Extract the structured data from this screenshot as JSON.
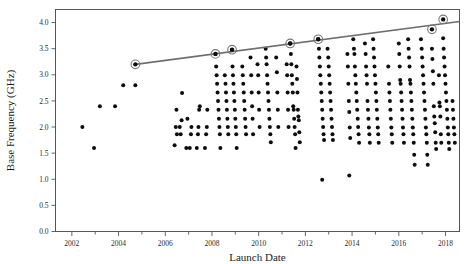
{
  "chart_data": {
    "type": "scatter",
    "title": "",
    "xlabel": "Launch Date",
    "ylabel": "Base Frequency (GHz)",
    "xlim": [
      2001.3,
      2018.6
    ],
    "ylim": [
      0.0,
      4.25
    ],
    "grid": false,
    "legend": "none",
    "x_ticks_major": [
      2002,
      2004,
      2006,
      2008,
      2010,
      2012,
      2014,
      2016,
      2018
    ],
    "x_ticks_minor": [
      2003,
      2005,
      2007,
      2009,
      2011,
      2013,
      2015,
      2017
    ],
    "y_ticks": [
      0.0,
      0.5,
      1.0,
      1.5,
      2.0,
      2.5,
      3.0,
      3.5,
      4.0
    ],
    "y_tick_labels": [
      "0.0",
      "0.5",
      "1.0",
      "1.5",
      "2.0",
      "2.5",
      "3.0",
      "3.5",
      "4.0"
    ],
    "x_tick_labels": [
      "2002",
      "2004",
      "2006",
      "2008",
      "2010",
      "2012",
      "2014",
      "2016",
      "2018"
    ],
    "series": [
      {
        "name": "Processors",
        "marker": "filled-circle",
        "color": "#0d0d0d",
        "points": [
          [
            2002.45,
            2.0
          ],
          [
            2002.95,
            1.6
          ],
          [
            2003.2,
            2.4
          ],
          [
            2003.85,
            2.4
          ],
          [
            2004.2,
            2.8
          ],
          [
            2004.72,
            2.8
          ],
          [
            2006.4,
            1.65
          ],
          [
            2006.45,
            2.0
          ],
          [
            2006.48,
            2.33
          ],
          [
            2006.5,
            1.86
          ],
          [
            2006.62,
            2.0
          ],
          [
            2006.66,
            1.86
          ],
          [
            2006.7,
            2.13
          ],
          [
            2006.72,
            2.65
          ],
          [
            2006.9,
            1.6
          ],
          [
            2006.95,
            2.16
          ],
          [
            2007.05,
            1.6
          ],
          [
            2007.1,
            1.86
          ],
          [
            2007.12,
            2.0
          ],
          [
            2007.35,
            1.6
          ],
          [
            2007.4,
            1.86
          ],
          [
            2007.42,
            2.0
          ],
          [
            2007.45,
            2.33
          ],
          [
            2007.48,
            2.4
          ],
          [
            2007.7,
            1.6
          ],
          [
            2007.75,
            1.86
          ],
          [
            2007.78,
            2.0
          ],
          [
            2007.8,
            2.33
          ],
          [
            2008.15,
            3.4
          ],
          [
            2008.18,
            3.16
          ],
          [
            2008.2,
            2.99
          ],
          [
            2008.22,
            2.83
          ],
          [
            2008.24,
            2.66
          ],
          [
            2008.26,
            2.5
          ],
          [
            2008.28,
            2.33
          ],
          [
            2008.3,
            2.16
          ],
          [
            2008.32,
            2.0
          ],
          [
            2008.34,
            1.86
          ],
          [
            2008.36,
            1.6
          ],
          [
            2008.55,
            2.99
          ],
          [
            2008.58,
            2.83
          ],
          [
            2008.6,
            2.66
          ],
          [
            2008.62,
            2.5
          ],
          [
            2008.64,
            2.33
          ],
          [
            2008.66,
            2.16
          ],
          [
            2008.68,
            2.0
          ],
          [
            2008.7,
            1.86
          ],
          [
            2008.86,
            3.48
          ],
          [
            2008.88,
            3.16
          ],
          [
            2008.9,
            2.99
          ],
          [
            2008.92,
            2.83
          ],
          [
            2008.94,
            2.66
          ],
          [
            2008.96,
            2.5
          ],
          [
            2008.98,
            2.33
          ],
          [
            2009.0,
            2.16
          ],
          [
            2009.02,
            2.0
          ],
          [
            2009.04,
            1.86
          ],
          [
            2009.06,
            1.6
          ],
          [
            2009.3,
            3.16
          ],
          [
            2009.32,
            2.99
          ],
          [
            2009.34,
            2.83
          ],
          [
            2009.36,
            2.66
          ],
          [
            2009.38,
            2.5
          ],
          [
            2009.4,
            2.33
          ],
          [
            2009.42,
            2.16
          ],
          [
            2009.44,
            2.0
          ],
          [
            2009.46,
            1.86
          ],
          [
            2009.65,
            3.33
          ],
          [
            2009.68,
            2.99
          ],
          [
            2009.7,
            2.66
          ],
          [
            2009.72,
            2.4
          ],
          [
            2009.74,
            2.16
          ],
          [
            2009.76,
            1.86
          ],
          [
            2009.95,
            3.2
          ],
          [
            2009.98,
            2.99
          ],
          [
            2010.0,
            2.66
          ],
          [
            2010.02,
            2.33
          ],
          [
            2010.04,
            2.0
          ],
          [
            2010.3,
            3.5
          ],
          [
            2010.32,
            3.33
          ],
          [
            2010.34,
            3.2
          ],
          [
            2010.36,
            2.99
          ],
          [
            2010.38,
            2.83
          ],
          [
            2010.4,
            2.66
          ],
          [
            2010.42,
            2.5
          ],
          [
            2010.44,
            2.33
          ],
          [
            2010.46,
            2.16
          ],
          [
            2010.48,
            2.0
          ],
          [
            2010.5,
            1.86
          ],
          [
            2010.52,
            1.71
          ],
          [
            2010.75,
            3.33
          ],
          [
            2010.78,
            3.05
          ],
          [
            2010.8,
            2.66
          ],
          [
            2010.82,
            2.33
          ],
          [
            2010.84,
            2.0
          ],
          [
            2011.2,
            3.2
          ],
          [
            2011.22,
            2.99
          ],
          [
            2011.24,
            2.66
          ],
          [
            2011.26,
            2.33
          ],
          [
            2011.28,
            2.0
          ],
          [
            2011.35,
            3.6
          ],
          [
            2011.38,
            3.4
          ],
          [
            2011.4,
            3.2
          ],
          [
            2011.42,
            2.99
          ],
          [
            2011.44,
            2.83
          ],
          [
            2011.46,
            2.66
          ],
          [
            2011.48,
            2.4
          ],
          [
            2011.5,
            2.33
          ],
          [
            2011.52,
            2.16
          ],
          [
            2011.54,
            2.0
          ],
          [
            2011.56,
            1.86
          ],
          [
            2011.58,
            1.6
          ],
          [
            2011.62,
            3.16
          ],
          [
            2011.64,
            2.92
          ],
          [
            2011.66,
            2.66
          ],
          [
            2011.68,
            2.33
          ],
          [
            2011.7,
            2.2
          ],
          [
            2011.72,
            2.13
          ],
          [
            2011.74,
            1.9
          ],
          [
            2011.76,
            1.71
          ],
          [
            2012.55,
            3.68
          ],
          [
            2012.58,
            3.5
          ],
          [
            2012.6,
            3.33
          ],
          [
            2012.62,
            3.16
          ],
          [
            2012.64,
            2.99
          ],
          [
            2012.66,
            2.83
          ],
          [
            2012.68,
            2.66
          ],
          [
            2012.7,
            2.5
          ],
          [
            2012.72,
            2.33
          ],
          [
            2012.74,
            2.16
          ],
          [
            2012.76,
            2.0
          ],
          [
            2012.78,
            1.86
          ],
          [
            2012.8,
            1.75
          ],
          [
            2012.72,
            0.99
          ],
          [
            2012.95,
            3.5
          ],
          [
            2012.98,
            3.33
          ],
          [
            2013.0,
            3.16
          ],
          [
            2013.02,
            2.99
          ],
          [
            2013.04,
            2.83
          ],
          [
            2013.06,
            2.66
          ],
          [
            2013.08,
            2.5
          ],
          [
            2013.1,
            2.33
          ],
          [
            2013.12,
            2.16
          ],
          [
            2013.14,
            2.0
          ],
          [
            2013.16,
            1.86
          ],
          [
            2013.18,
            1.75
          ],
          [
            2013.8,
            3.4
          ],
          [
            2013.82,
            3.16
          ],
          [
            2013.84,
            2.83
          ],
          [
            2013.86,
            2.5
          ],
          [
            2013.88,
            2.29
          ],
          [
            2013.9,
            1.99
          ],
          [
            2013.92,
            1.79
          ],
          [
            2013.88,
            1.07
          ],
          [
            2014.05,
            3.68
          ],
          [
            2014.08,
            3.5
          ],
          [
            2014.1,
            3.4
          ],
          [
            2014.12,
            3.16
          ],
          [
            2014.14,
            2.99
          ],
          [
            2014.16,
            2.83
          ],
          [
            2014.18,
            2.66
          ],
          [
            2014.2,
            2.5
          ],
          [
            2014.22,
            2.33
          ],
          [
            2014.24,
            2.16
          ],
          [
            2014.26,
            2.0
          ],
          [
            2014.28,
            1.86
          ],
          [
            2014.3,
            1.7
          ],
          [
            2014.55,
            3.6
          ],
          [
            2014.58,
            3.4
          ],
          [
            2014.6,
            3.16
          ],
          [
            2014.62,
            2.99
          ],
          [
            2014.64,
            2.83
          ],
          [
            2014.66,
            2.5
          ],
          [
            2014.68,
            2.33
          ],
          [
            2014.7,
            2.16
          ],
          [
            2014.72,
            1.99
          ],
          [
            2014.74,
            1.86
          ],
          [
            2014.76,
            1.7
          ],
          [
            2014.9,
            3.68
          ],
          [
            2014.92,
            3.5
          ],
          [
            2014.94,
            3.33
          ],
          [
            2014.96,
            3.16
          ],
          [
            2014.98,
            2.99
          ],
          [
            2015.0,
            2.83
          ],
          [
            2015.02,
            2.66
          ],
          [
            2015.04,
            2.5
          ],
          [
            2015.06,
            2.33
          ],
          [
            2015.08,
            2.16
          ],
          [
            2015.1,
            1.99
          ],
          [
            2015.12,
            1.86
          ],
          [
            2015.14,
            1.7
          ],
          [
            2015.55,
            3.16
          ],
          [
            2015.58,
            2.83
          ],
          [
            2015.6,
            2.66
          ],
          [
            2015.62,
            2.5
          ],
          [
            2015.64,
            2.33
          ],
          [
            2015.66,
            2.16
          ],
          [
            2015.68,
            1.99
          ],
          [
            2015.7,
            1.86
          ],
          [
            2015.72,
            1.7
          ],
          [
            2016.0,
            3.6
          ],
          [
            2016.02,
            3.4
          ],
          [
            2016.04,
            3.16
          ],
          [
            2016.06,
            2.9
          ],
          [
            2016.08,
            2.83
          ],
          [
            2016.1,
            2.66
          ],
          [
            2016.12,
            2.5
          ],
          [
            2016.14,
            2.33
          ],
          [
            2016.16,
            2.16
          ],
          [
            2016.18,
            1.99
          ],
          [
            2016.2,
            1.86
          ],
          [
            2016.22,
            1.7
          ],
          [
            2016.4,
            3.68
          ],
          [
            2016.42,
            3.5
          ],
          [
            2016.44,
            3.33
          ],
          [
            2016.46,
            3.16
          ],
          [
            2016.48,
            2.9
          ],
          [
            2016.5,
            2.83
          ],
          [
            2016.52,
            2.66
          ],
          [
            2016.54,
            2.5
          ],
          [
            2016.56,
            2.33
          ],
          [
            2016.58,
            2.16
          ],
          [
            2016.6,
            1.99
          ],
          [
            2016.62,
            1.86
          ],
          [
            2016.64,
            1.7
          ],
          [
            2016.66,
            1.47
          ],
          [
            2016.68,
            1.28
          ],
          [
            2016.95,
            3.68
          ],
          [
            2016.98,
            3.5
          ],
          [
            2017.0,
            3.33
          ],
          [
            2017.02,
            3.16
          ],
          [
            2017.04,
            2.99
          ],
          [
            2017.06,
            2.83
          ],
          [
            2017.08,
            2.66
          ],
          [
            2017.1,
            2.5
          ],
          [
            2017.12,
            2.33
          ],
          [
            2017.14,
            2.16
          ],
          [
            2017.16,
            1.99
          ],
          [
            2017.18,
            1.86
          ],
          [
            2017.2,
            1.7
          ],
          [
            2017.22,
            1.47
          ],
          [
            2017.24,
            1.28
          ],
          [
            2017.42,
            3.5
          ],
          [
            2017.44,
            3.3
          ],
          [
            2017.46,
            3.07
          ],
          [
            2017.48,
            2.83
          ],
          [
            2017.5,
            2.4
          ],
          [
            2017.52,
            2.2
          ],
          [
            2017.54,
            2.07
          ],
          [
            2017.56,
            1.9
          ],
          [
            2017.58,
            1.7
          ],
          [
            2017.6,
            1.58
          ],
          [
            2017.72,
            2.99
          ],
          [
            2017.74,
            2.47
          ],
          [
            2017.76,
            2.4
          ],
          [
            2017.78,
            2.2
          ],
          [
            2017.8,
            1.86
          ],
          [
            2017.82,
            1.7
          ],
          [
            2017.9,
            3.7
          ],
          [
            2017.92,
            3.5
          ],
          [
            2017.94,
            3.33
          ],
          [
            2017.96,
            3.16
          ],
          [
            2017.98,
            2.99
          ],
          [
            2018.0,
            2.83
          ],
          [
            2018.02,
            2.66
          ],
          [
            2018.04,
            2.5
          ],
          [
            2018.06,
            2.33
          ],
          [
            2018.08,
            2.16
          ],
          [
            2018.1,
            1.99
          ],
          [
            2018.12,
            1.86
          ],
          [
            2018.14,
            1.7
          ],
          [
            2018.16,
            1.58
          ],
          [
            2018.3,
            2.5
          ],
          [
            2018.32,
            2.33
          ],
          [
            2018.34,
            2.16
          ],
          [
            2018.36,
            1.99
          ],
          [
            2018.38,
            1.86
          ],
          [
            2018.4,
            1.7
          ]
        ]
      },
      {
        "name": "Record Holders",
        "marker": "circled-dot",
        "color": "#0d0d0d",
        "ring_color": "#777777",
        "points": [
          [
            2004.72,
            3.2
          ],
          [
            2008.15,
            3.4
          ],
          [
            2008.86,
            3.48
          ],
          [
            2011.35,
            3.6
          ],
          [
            2012.55,
            3.68
          ],
          [
            2017.42,
            3.87
          ],
          [
            2017.9,
            4.06
          ]
        ]
      }
    ],
    "trend_line": {
      "name": "Record trend",
      "color": "#6e6e6e",
      "start": [
        2004.72,
        3.2
      ],
      "end": [
        2018.6,
        4.02
      ]
    }
  }
}
